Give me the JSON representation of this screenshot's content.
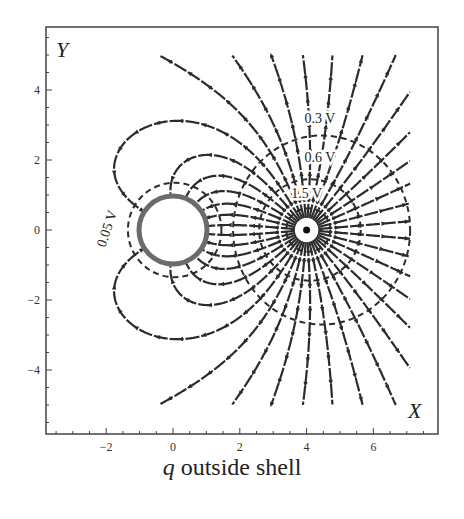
{
  "figure": {
    "caption_symbol": "q",
    "caption_text": " outside shell",
    "x_axis_letter": "X",
    "y_axis_letter": "Y",
    "x_ticks": [
      {
        "value": -2,
        "label": "−2"
      },
      {
        "value": 0,
        "label": "0"
      },
      {
        "value": 2,
        "label": "2"
      },
      {
        "value": 4,
        "label": "4"
      },
      {
        "value": 6,
        "label": "6"
      }
    ],
    "y_ticks": [
      {
        "value": 4,
        "label": "4"
      },
      {
        "value": 2,
        "label": "2"
      },
      {
        "value": 0,
        "label": "0"
      },
      {
        "value": -2,
        "label": "−2"
      },
      {
        "value": -4,
        "label": "−4"
      }
    ],
    "equipotential_labels": [
      {
        "text": "0.05 V",
        "x": -1.85,
        "y": 0.0,
        "rotate": -72
      },
      {
        "text": "0.3 V",
        "x": 4.4,
        "y": 3.05
      },
      {
        "text": "0.6 V",
        "x": 4.4,
        "y": 1.95
      },
      {
        "text": "1.5 V",
        "x": 4.0,
        "y": 0.92
      }
    ],
    "colors": {
      "field_line": "#2b2b2b",
      "shell": "#6b6b6b",
      "frame": "#444444",
      "charge": "#111111"
    }
  },
  "chart_data": {
    "type": "vector-field",
    "title": "q outside shell",
    "xlabel": "X",
    "ylabel": "Y",
    "xlim": [
      -3.8,
      7.9
    ],
    "ylim": [
      -5.8,
      5.8
    ],
    "x_ticks": [
      -2,
      0,
      2,
      4,
      6
    ],
    "y_ticks": [
      -4,
      -2,
      0,
      2,
      4
    ],
    "grid": false,
    "point_charge": {
      "x": 4,
      "y": 0,
      "label": "q"
    },
    "grounded_shell": {
      "center": [
        0,
        0
      ],
      "radius": 1
    },
    "image_charge": {
      "x": 0.25,
      "y": 0,
      "q_ratio": -0.25
    },
    "equipotentials": [
      {
        "label": "0.05 V",
        "shape": "dashed circle around shell",
        "approx_center": [
          0,
          0
        ],
        "approx_radius": 1.4
      },
      {
        "label": "0.3 V",
        "approx_center": [
          4.4,
          0
        ],
        "approx_radius": 2.7
      },
      {
        "label": "0.6 V",
        "approx_center": [
          4.1,
          0
        ],
        "approx_radius": 1.5
      },
      {
        "label": "1.5 V",
        "approx_center": [
          4.05,
          0
        ],
        "approx_radius": 0.65
      }
    ],
    "field_lines": "radiate outward from q at (4,0); lines leftward curve and terminate on shell"
  }
}
